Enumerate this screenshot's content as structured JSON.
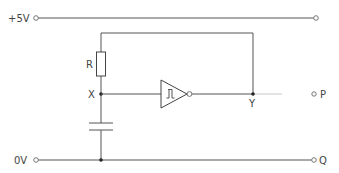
{
  "diagram": {
    "type": "circuit",
    "labels": {
      "supply": "+5V",
      "ground": "0V",
      "resistor": "R",
      "node_x": "X",
      "node_y": "Y",
      "terminal_p": "P",
      "terminal_q": "Q"
    },
    "components": [
      {
        "id": "R",
        "type": "resistor",
        "between": [
          "Y(feedback)",
          "X"
        ]
      },
      {
        "id": "C",
        "type": "capacitor",
        "between": [
          "X",
          "0V"
        ]
      },
      {
        "id": "U1",
        "type": "schmitt-trigger-inverter",
        "input": "X",
        "output": "Y"
      }
    ],
    "colors": {
      "line": "#555555",
      "text": "#444444",
      "background": "#ffffff"
    }
  }
}
